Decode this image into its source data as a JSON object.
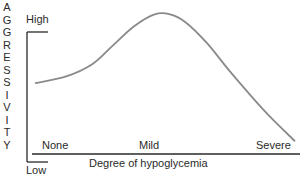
{
  "chart_data": {
    "type": "line",
    "title": "",
    "ylabel": "AGGRESSIVITY",
    "xlabel": "Degree of hypoglycemia",
    "y_range_labels": {
      "high": "High",
      "low": "Low"
    },
    "x_categories": [
      "None",
      "Mild",
      "Severe"
    ],
    "xlim": [
      0,
      1
    ],
    "ylim": [
      0,
      1
    ],
    "grid": false,
    "series": [
      {
        "name": "Aggressivity",
        "color": "#8a8a8a",
        "points": [
          [
            0.0,
            0.48
          ],
          [
            0.12,
            0.53
          ],
          [
            0.22,
            0.62
          ],
          [
            0.3,
            0.76
          ],
          [
            0.38,
            0.9
          ],
          [
            0.46,
            0.99
          ],
          [
            0.52,
            0.99
          ],
          [
            0.58,
            0.93
          ],
          [
            0.66,
            0.78
          ],
          [
            0.74,
            0.59
          ],
          [
            0.82,
            0.41
          ],
          [
            0.9,
            0.24
          ],
          [
            1.0,
            0.05
          ]
        ]
      }
    ]
  }
}
